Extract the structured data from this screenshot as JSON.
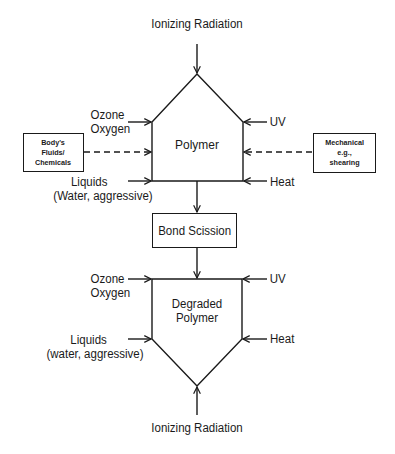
{
  "diagram": {
    "top_source": "Ionizing Radiation",
    "bottom_source": "Ionizing Radiation",
    "polymer": {
      "label": "Polymer",
      "left_inputs": [
        {
          "lines": [
            "Ozone",
            "Oxygen"
          ]
        },
        {
          "lines": [
            "Liquids",
            "(Water, aggressive)"
          ]
        }
      ],
      "right_inputs": [
        {
          "label": "UV"
        },
        {
          "label": "Heat"
        }
      ]
    },
    "side_boxes": {
      "left": {
        "lines": [
          "Body's",
          "Fluids/",
          "Chemicals"
        ],
        "connector": "dashed"
      },
      "right": {
        "lines": [
          "Mechanical",
          "e.g.,",
          "shearing"
        ],
        "connector": "dashed"
      }
    },
    "process": {
      "label": "Bond Scission"
    },
    "degraded": {
      "lines": [
        "Degraded",
        "Polymer"
      ],
      "left_inputs": [
        {
          "lines": [
            "Ozone",
            "Oxygen"
          ]
        },
        {
          "lines": [
            "Liquids",
            "(water, aggressive)"
          ]
        }
      ],
      "right_inputs": [
        {
          "label": "UV"
        },
        {
          "label": "Heat"
        }
      ]
    },
    "colors": {
      "ink": "#1a1a1a",
      "background": "#ffffff"
    }
  }
}
